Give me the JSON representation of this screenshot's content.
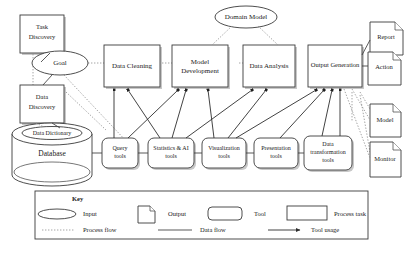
{
  "diagram": {
    "colors": {
      "background": "#ffffff",
      "stroke": "#3a3a3a",
      "process_flow": "#8d8d8d",
      "data_flow": "#3c3c3c",
      "tool_usage": "#2e2e2e",
      "shadow": "#9a9a9a",
      "text": "#1a1a1a"
    },
    "inputs": [
      {
        "id": "goal",
        "label": "Goal",
        "shape": "ellipse"
      },
      {
        "id": "data-dictionary",
        "label": "Data Dictionary",
        "shape": "ellipse"
      },
      {
        "id": "domain-model",
        "label": "Domain Model",
        "shape": "ellipse"
      }
    ],
    "process_tasks": [
      {
        "id": "task-discovery",
        "label_line1": "Task",
        "label_line2": "Discovery"
      },
      {
        "id": "data-discovery",
        "label_line1": "Data",
        "label_line2": "Discovery"
      },
      {
        "id": "data-cleaning",
        "label_line1": "Data Cleaning",
        "label_line2": ""
      },
      {
        "id": "model-development",
        "label_line1": "Model",
        "label_line2": "Development"
      },
      {
        "id": "data-analysis",
        "label_line1": "Data Analysis",
        "label_line2": ""
      },
      {
        "id": "output-generation",
        "label_line1": "Output Generation",
        "label_line2": ""
      }
    ],
    "database": {
      "id": "database",
      "label": "Database"
    },
    "tools": [
      {
        "id": "query-tools",
        "label_line1": "Query",
        "label_line2": "tools",
        "label_line3": ""
      },
      {
        "id": "statistics-ai-tools",
        "label_line1": "Statistics & AI",
        "label_line2": "tools",
        "label_line3": ""
      },
      {
        "id": "visualization-tools",
        "label_line1": "Visualization",
        "label_line2": "tools",
        "label_line3": ""
      },
      {
        "id": "presentation-tools",
        "label_line1": "Presentation",
        "label_line2": "tools",
        "label_line3": ""
      },
      {
        "id": "data-transformation-tools",
        "label_line1": "Data",
        "label_line2": "transformation",
        "label_line3": "tools"
      }
    ],
    "outputs": [
      {
        "id": "report",
        "label": "Report"
      },
      {
        "id": "action",
        "label": "Action"
      },
      {
        "id": "model",
        "label": "Model"
      },
      {
        "id": "monitor",
        "label": "Monitor"
      }
    ]
  },
  "legend": {
    "title": "Key",
    "shapes": [
      {
        "id": "input",
        "label": "Input",
        "shape": "ellipse"
      },
      {
        "id": "output",
        "label": "Output",
        "shape": "document"
      },
      {
        "id": "tool",
        "label": "Tool",
        "shape": "rounded-rect"
      },
      {
        "id": "process-task",
        "label": "Process task",
        "shape": "rect"
      }
    ],
    "lines": [
      {
        "id": "process-flow",
        "label": "Process flow",
        "style": "dotted"
      },
      {
        "id": "data-flow",
        "label": "Data flow",
        "style": "solid"
      },
      {
        "id": "tool-usage",
        "label": "Tool usage",
        "style": "arrow"
      }
    ]
  }
}
